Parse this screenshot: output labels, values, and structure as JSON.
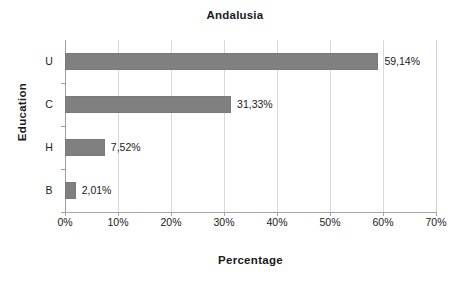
{
  "chart_data": {
    "type": "bar",
    "orientation": "horizontal",
    "title": "Andalusia",
    "xlabel": "Percentage",
    "ylabel": "Education",
    "categories": [
      "U",
      "C",
      "H",
      "B"
    ],
    "values": [
      59.14,
      31.33,
      7.52,
      2.01
    ],
    "data_labels": [
      "59,14%",
      "31,33%",
      "7,52%",
      "2,01%"
    ],
    "xlim": [
      0,
      70
    ],
    "xticks": [
      0,
      10,
      20,
      30,
      40,
      50,
      60,
      70
    ],
    "xtick_labels": [
      "0%",
      "10%",
      "20%",
      "30%",
      "40%",
      "50%",
      "60%",
      "70%"
    ],
    "grid": "vertical",
    "legend": "none",
    "series": [
      {
        "name": "Percentage",
        "color": "#808080",
        "values": [
          59.14,
          31.33,
          7.52,
          2.01
        ]
      }
    ],
    "colors": {
      "bar": "#808080",
      "bar_border": "#7a7a7a",
      "gridline": "#d9d9d9",
      "axis": "#a6a6a6",
      "text": "#1a1a1a",
      "background": "#ffffff"
    }
  }
}
